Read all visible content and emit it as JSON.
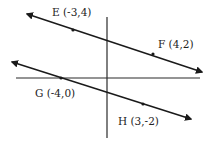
{
  "diagram": {
    "colors": {
      "line": "#1a1a1a",
      "axis": "#2a2a2a",
      "background": "#ffffff"
    },
    "axes": {
      "vertical": {
        "x": 107,
        "y1": 17,
        "y2": 138
      },
      "horizontal": {
        "y": 78,
        "x1": 16,
        "x2": 200
      }
    },
    "lines": [
      {
        "name": "EF",
        "start": [
          27,
          14
        ],
        "end": [
          202,
          72
        ],
        "points": [
          {
            "label": "E (-3,4)",
            "dot": [
              73,
              30
            ],
            "text_pos": [
              52,
              16
            ]
          },
          {
            "label": "F (4,2)",
            "dot": [
              153,
              54
            ],
            "text_pos": [
              158,
              48
            ]
          }
        ]
      },
      {
        "name": "GH",
        "start": [
          12,
          62
        ],
        "end": [
          191,
          119
        ],
        "points": [
          {
            "label": "G (-4,0)",
            "dot": [
              61,
              78
            ],
            "text_pos": [
              35,
              97
            ]
          },
          {
            "label": "H (3,-2)",
            "dot": [
              143,
              104
            ],
            "text_pos": [
              118,
              125
            ]
          }
        ]
      }
    ]
  }
}
